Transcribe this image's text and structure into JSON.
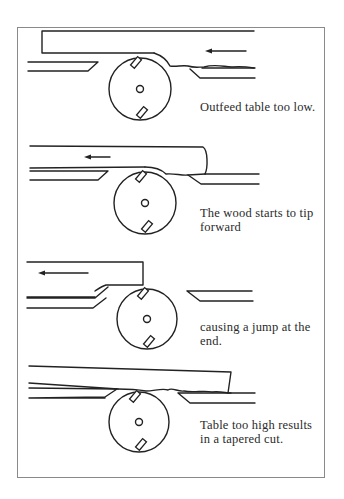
{
  "figure": {
    "border_color": "#8a8a8a",
    "line_color": "#222222",
    "text_color": "#2a2a2a"
  },
  "panels": [
    {
      "id": "outfeed-too-low",
      "caption": "Outfeed table too low.",
      "caption_top": 100,
      "cutter": {
        "cx": 140,
        "cy": 89,
        "r": 31
      },
      "feed_arrow": {
        "direction": "left",
        "x1": 246,
        "x2": 205,
        "y": 51
      },
      "board": "M42 31 L254 31 M42 31 L42 53 L154 53",
      "outfeed_table": "M28 62 L98 62 L88 71 L28 71",
      "infeed_table": "M190 69 L200 78 L255 78 M202 68 L255 68",
      "cut_surface": "M154 53 C160 55 166 58 170 66 C176 67 182 65 188 66 C194 68 198 67 204 67 C214 64 220 66 232 67 C240 66 248 67 254 68"
    },
    {
      "id": "wood-tips-forward",
      "caption": "The wood starts to tip forward",
      "caption_top": 206,
      "cutter": {
        "cx": 145,
        "cy": 203,
        "r": 31
      },
      "feed_arrow": {
        "direction": "left",
        "x1": 110,
        "x2": 84,
        "y": 157
      },
      "board": "M30 146 L203 147 C208 150 208 168 205 174 M30 168 L145 167",
      "outfeed_table": "M30 171 L108 171 L98 180 L30 180",
      "infeed_table": "M188 175 L201 184 L259 184 M205 174 L259 174",
      "cut_surface": "M145 167 C152 167 160 168 166 174 C174 173 182 176 188 175 L205 174"
    },
    {
      "id": "jump-at-end",
      "caption": "causing a jump at the end.",
      "caption_top": 320,
      "cutter": {
        "cx": 147,
        "cy": 319,
        "r": 30
      },
      "feed_arrow": {
        "direction": "left",
        "x1": 88,
        "x2": 38,
        "y": 273
      },
      "board": "M27 262 L143 262 L143 285 L106 285 C102 286 98 289 95 291",
      "outfeed_table": "M27 298 L95 298 L108 287 M27 297 L95 297 M27 308 L93 308 L106 298",
      "infeed_table": "M187 291 L200 301 L253 301 M187 291 L252 291",
      "cut_surface": ""
    },
    {
      "id": "table-too-high",
      "caption": "Table too high results in a tapered cut.",
      "caption_top": 418,
      "cutter": {
        "cx": 139,
        "cy": 422,
        "r": 30
      },
      "feed_arrow": null,
      "board": "M29 366 L231 372 L228 393 M29 383 L118 389",
      "outfeed_table": "M29 388 L117 389 L105 397 L29 398 M29 398 L105 398",
      "infeed_table": "M178 393 L190 403 L255 403 M178 393 L255 393",
      "cut_surface": "M118 389 C126 389 134 389 146 391 C154 391 162 388 168 390 C172 387 178 392 184 391 C194 393 204 390 212 392 C220 391 226 393 231 393"
    }
  ]
}
